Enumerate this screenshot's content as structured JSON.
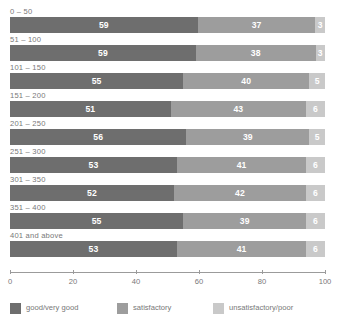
{
  "chart_data": {
    "type": "bar",
    "orientation": "horizontal",
    "stacked": true,
    "stack_mode": "percent",
    "title": "",
    "subtitle": "",
    "xlabel": "",
    "ylabel": "",
    "xlim": [
      0,
      100
    ],
    "xticks": [
      0,
      20,
      40,
      60,
      80,
      100
    ],
    "xtick_labels": [
      "0",
      "20",
      "40",
      "60",
      "80",
      "100"
    ],
    "grid": false,
    "legend_position": "bottom-left",
    "categories": [
      "0 – 50",
      "51 – 100",
      "101 – 150",
      "151 – 200",
      "201 – 250",
      "251 – 300",
      "301 – 350",
      "351 – 400",
      "401 and above"
    ],
    "series": [
      {
        "name": "good/very good",
        "color": "#6e6e6e",
        "values": [
          59,
          59,
          55,
          51,
          56,
          53,
          52,
          55,
          53
        ]
      },
      {
        "name": "satisfactory",
        "color": "#9d9d9d",
        "values": [
          37,
          38,
          40,
          43,
          39,
          41,
          42,
          39,
          41
        ]
      },
      {
        "name": "unsatisfactory/poor",
        "color": "#c9c9c9",
        "values": [
          3,
          3,
          5,
          6,
          5,
          6,
          6,
          6,
          6
        ]
      }
    ]
  }
}
